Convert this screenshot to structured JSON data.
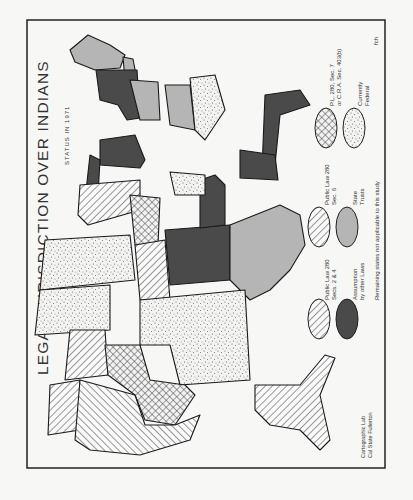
{
  "map": {
    "title": "LEGAL JURISDICTION OVER INDIANS",
    "subtitle": "STATUS IN 1971",
    "initials": "fch",
    "credit_line1": "Cartographic Lab",
    "credit_line2": "Cal State Fullerton",
    "orientation": "rotated 90° counter-clockwise",
    "legend": {
      "items": [
        {
          "pattern": "diagonal-hatch",
          "label_line1": "Public Law 280",
          "label_line2": "Secs. 2 & 4"
        },
        {
          "pattern": "dark-solid",
          "label_line1": "Assumption",
          "label_line2": "by other Laws"
        },
        {
          "pattern": "fine-diagonal-hatch",
          "label_line1": "Public Law 280",
          "label_line2": "Sec. 6"
        },
        {
          "pattern": "light-gray",
          "label_line1": "State",
          "label_line2": "Trusts"
        },
        {
          "pattern": "crosshatch",
          "label_line1": "P.L. 280, Sec. 7",
          "label_line2": "or C.R.A. Sec. 403(b)"
        },
        {
          "pattern": "stipple",
          "label_line1": "Currently",
          "label_line2": "Federal"
        }
      ],
      "footnote": "Remaining states not applicable to this study"
    },
    "colors": {
      "dark": "#4a4a4a",
      "gray": "#b5b5b5",
      "outline": "#1a1a1a",
      "paper": "#f7f7f5"
    }
  }
}
